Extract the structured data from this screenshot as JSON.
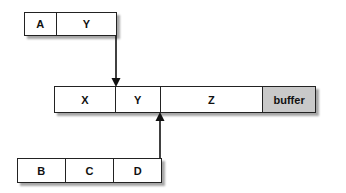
{
  "diagram": {
    "top_box": {
      "cells": [
        {
          "label": "A",
          "width": 32
        },
        {
          "label": "Y",
          "width": 60
        }
      ]
    },
    "main_bar": {
      "cells": [
        {
          "label": "X",
          "width": 61
        },
        {
          "label": "Y",
          "width": 45
        },
        {
          "label": "Z",
          "width": 103
        },
        {
          "label": "buffer",
          "width": 52,
          "fill": "#c9c9c9"
        }
      ]
    },
    "bottom_box": {
      "cells": [
        {
          "label": "B",
          "width": 48
        },
        {
          "label": "C",
          "width": 49
        },
        {
          "label": "D",
          "width": 47
        }
      ]
    },
    "arrows": [
      {
        "from": "top_box.Y right edge",
        "to": "main_bar between X and Y",
        "direction": "down"
      },
      {
        "from": "bottom_box.D right edge",
        "to": "main_bar between Y and Z",
        "direction": "up"
      }
    ]
  }
}
